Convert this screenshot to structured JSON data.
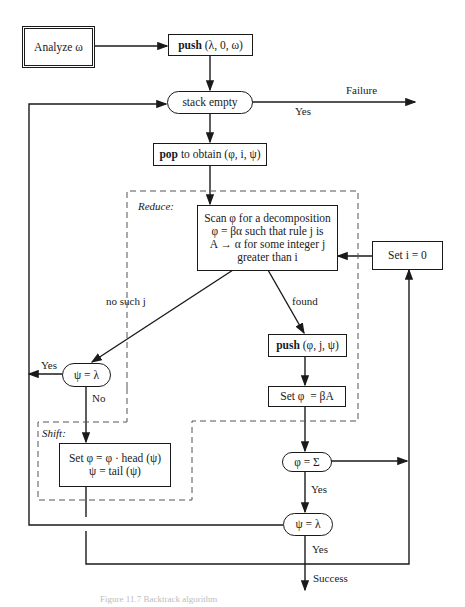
{
  "nodes": {
    "analyze": {
      "label": "Analyze ω"
    },
    "push_initial": {
      "bold": "push",
      "args": " (λ, 0, ω)"
    },
    "stack_empty": {
      "label": "stack empty"
    },
    "pop": {
      "bold": "pop",
      "rest": " to obtain (φ, i, ψ)"
    },
    "scan": {
      "lines": [
        "Scan φ for a decomposition",
        "φ = βα such that rule j is",
        "A → α for some integer j",
        "greater than i"
      ]
    },
    "set_i": {
      "label": "Set i = 0"
    },
    "psi_lambda_left": {
      "label": "ψ = λ"
    },
    "push_found": {
      "bold": "push",
      "args": " (φ, j, ψ)"
    },
    "set_phi_beta": {
      "label": "Set φ  = βA"
    },
    "shift_box": {
      "lines": [
        "Set φ = φ · head (ψ)",
        "ψ = tail (ψ)"
      ]
    },
    "phi_sigma": {
      "label": "φ = Σ"
    },
    "psi_lambda_bottom": {
      "label": "ψ = λ"
    }
  },
  "regions": {
    "reduce": "Reduce:",
    "shift": "Shift:"
  },
  "edge_labels": {
    "failure": "Failure",
    "yes_failure": "Yes",
    "no_such_j": "no such j",
    "found": "found",
    "yes_left": "Yes",
    "no_left": "No",
    "yes_sigma": "Yes",
    "yes_bottom": "Yes",
    "success": "Success"
  },
  "caption": "Figure 11.7  Backtrack algorithm"
}
